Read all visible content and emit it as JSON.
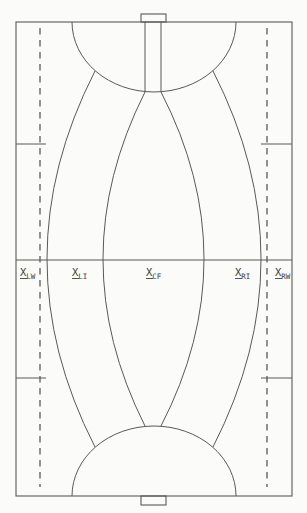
{
  "diagram": {
    "labels": [
      {
        "main": "X",
        "sub": "LW"
      },
      {
        "main": "X",
        "sub": "LI"
      },
      {
        "main": "X",
        "sub": "CF"
      },
      {
        "main": "X",
        "sub": "RI"
      },
      {
        "main": "X",
        "sub": "RW"
      }
    ],
    "colors": {
      "line": "#595959",
      "label_ink": "#3e3e3e",
      "paper": "#fbfbf9"
    }
  }
}
